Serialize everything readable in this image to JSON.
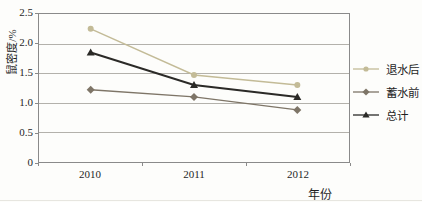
{
  "figure": {
    "background": "#fdfdfb",
    "border_color": "#8a8a8a",
    "gridline_color": "#b3b1ab",
    "text_color": "#1f1f1f"
  },
  "axes": {
    "y_title": "鼠密度/%",
    "x_title": "年份",
    "y_tick_labels": [
      "2.5",
      "2.0",
      "1.5",
      "1.0",
      "0.5",
      "0"
    ],
    "x_tick_labels": [
      "2010",
      "2011",
      "2012"
    ]
  },
  "legend": {
    "items": [
      "退水后",
      "蓄水前",
      "总计"
    ],
    "position": "right"
  },
  "chart_data": {
    "type": "line",
    "categories": [
      "2010",
      "2011",
      "2012"
    ],
    "series": [
      {
        "name": "退水后",
        "values": [
          2.25,
          1.47,
          1.3
        ],
        "color": "#c3bb97",
        "marker": "circle",
        "line_width": 1.4
      },
      {
        "name": "蓄水前",
        "values": [
          1.22,
          1.1,
          0.88
        ],
        "color": "#7e7567",
        "marker": "diamond",
        "line_width": 1.4
      },
      {
        "name": "总计",
        "values": [
          1.85,
          1.3,
          1.1
        ],
        "color": "#2b2a27",
        "marker": "triangle",
        "line_width": 2
      }
    ],
    "title": "",
    "xlabel": "年份",
    "ylabel": "鼠密度/%",
    "ylim": [
      0,
      2.5
    ],
    "yticks": [
      0,
      0.5,
      1.0,
      1.5,
      2.0,
      2.5
    ],
    "grid": true,
    "legend_position": "right"
  }
}
